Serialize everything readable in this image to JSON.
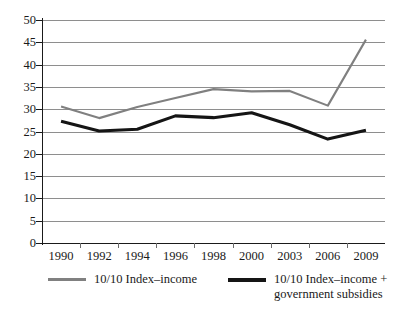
{
  "chart_data": {
    "type": "line",
    "title": "",
    "subtitle": "",
    "xlabel": "",
    "ylabel": "",
    "categories": [
      "1990",
      "1992",
      "1994",
      "1996",
      "1998",
      "2000",
      "2003",
      "2006",
      "2009"
    ],
    "ylim": [
      0,
      50
    ],
    "ytick_step": 5,
    "yticks": [
      "50",
      "45",
      "40",
      "35",
      "30",
      "25",
      "20",
      "15",
      "10",
      "5",
      "0"
    ],
    "grid": "horizontal",
    "legend_position": "bottom",
    "series": [
      {
        "name": "10/10 Index–income",
        "color": "#808080",
        "values": [
          30.6,
          28.0,
          30.5,
          32.5,
          34.5,
          34.0,
          34.1,
          30.8,
          45.6
        ]
      },
      {
        "name": "10/10 Index–income +\ngovernment subsidies",
        "color": "#151515",
        "values": [
          27.3,
          25.1,
          25.5,
          28.5,
          28.1,
          29.2,
          26.5,
          23.3,
          25.3
        ]
      }
    ]
  },
  "legend": {
    "items": [
      {
        "label": "10/10 Index–income",
        "color": "#808080"
      },
      {
        "label": "10/10 Index–income +\ngovernment subsidies",
        "color": "#151515"
      }
    ]
  },
  "colors": {
    "grid": "#8e8e8e",
    "axis": "#1a1a1a",
    "background": "#ffffff",
    "series_gray": "#808080",
    "series_black": "#151515"
  }
}
